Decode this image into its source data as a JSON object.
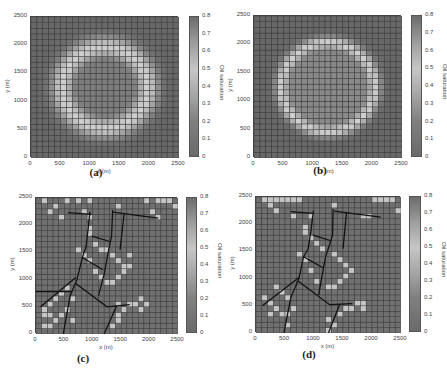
{
  "figure": {
    "colorbar": {
      "label": "Oil saturation",
      "ticks": [
        "0",
        "0.1",
        "0.2",
        "0.3",
        "0.4",
        "0.5",
        "0.6",
        "0.7",
        "0.8"
      ],
      "range": [
        0,
        0.8
      ]
    },
    "axes": {
      "xlabel": "x (m)",
      "ylabel": "y (m)",
      "xticks": [
        "0",
        "500",
        "1000",
        "1500",
        "2000",
        "2500"
      ],
      "yticks": [
        "0",
        "500",
        "1000",
        "1500",
        "2000",
        "2500"
      ],
      "range": [
        0,
        2500
      ],
      "grid_cells": 25
    }
  },
  "chart_data": [
    {
      "type": "heatmap",
      "caption": "(a)",
      "xlabel": "x (m)",
      "ylabel": "y (m)",
      "colorbar_label": "Oil saturation",
      "xlim": [
        0,
        2500
      ],
      "ylim": [
        0,
        2500
      ],
      "clim": [
        0,
        0.8
      ],
      "grid": "25x25 cells of 100 m",
      "pattern": "ring",
      "ring": {
        "cx": 1250,
        "cy": 1250,
        "radius": 720,
        "width": 260,
        "peak": 0.55,
        "background": 0.8,
        "center": 0.75
      },
      "fractures": []
    },
    {
      "type": "heatmap",
      "caption": "(b)",
      "xlabel": "x (m)",
      "ylabel": "y (m)",
      "colorbar_label": "Oil saturation",
      "xlim": [
        0,
        2500
      ],
      "ylim": [
        0,
        2500
      ],
      "clim": [
        0,
        0.8
      ],
      "grid": "25x25 cells of 100 m",
      "pattern": "ring",
      "ring": {
        "cx": 1250,
        "cy": 1250,
        "radius": 780,
        "width": 160,
        "peak": 0.55,
        "background": 0.8,
        "center": 0.72
      },
      "fractures": []
    },
    {
      "type": "heatmap",
      "caption": "(c)",
      "xlabel": "x (m)",
      "ylabel": "y (m)",
      "colorbar_label": "Oil saturation",
      "xlim": [
        0,
        2500
      ],
      "ylim": [
        0,
        2500
      ],
      "clim": [
        0,
        0.8
      ],
      "grid": "25x25 cells of 100 m",
      "pattern": "fractured",
      "bright_cells": [
        [
          1,
          24
        ],
        [
          3,
          23
        ],
        [
          5,
          24
        ],
        [
          7,
          24
        ],
        [
          9,
          24
        ],
        [
          19,
          24
        ],
        [
          21,
          24
        ],
        [
          22,
          24
        ],
        [
          23,
          24
        ],
        [
          24,
          23
        ],
        [
          2,
          22
        ],
        [
          4,
          21
        ],
        [
          8,
          22
        ],
        [
          9,
          21
        ],
        [
          14,
          23
        ],
        [
          20,
          22
        ],
        [
          21,
          21
        ],
        [
          9,
          19
        ],
        [
          9,
          18
        ],
        [
          10,
          16
        ],
        [
          11,
          15
        ],
        [
          12,
          15
        ],
        [
          13,
          14
        ],
        [
          14,
          13
        ],
        [
          15,
          12
        ],
        [
          15,
          11
        ],
        [
          14,
          10
        ],
        [
          13,
          9
        ],
        [
          12,
          9
        ],
        [
          11,
          10
        ],
        [
          10,
          11
        ],
        [
          9,
          13
        ],
        [
          8,
          14
        ],
        [
          7,
          15
        ],
        [
          16,
          14
        ],
        [
          16,
          12
        ],
        [
          5,
          8
        ],
        [
          4,
          7
        ],
        [
          3,
          6
        ],
        [
          2,
          5
        ],
        [
          1,
          4
        ],
        [
          1,
          3
        ],
        [
          2,
          3
        ],
        [
          3,
          2
        ],
        [
          2,
          1
        ],
        [
          1,
          1
        ],
        [
          4,
          3
        ],
        [
          5,
          4
        ],
        [
          6,
          2
        ],
        [
          14,
          5
        ],
        [
          15,
          4
        ],
        [
          16,
          5
        ],
        [
          17,
          5
        ],
        [
          18,
          4
        ],
        [
          19,
          5
        ],
        [
          18,
          6
        ],
        [
          14,
          3
        ],
        [
          14,
          2
        ],
        [
          13,
          1
        ],
        [
          6,
          6
        ]
      ],
      "fractures": [
        [
          [
            560,
            2230
          ],
          [
            980,
            2200
          ]
        ],
        [
          [
            950,
            2250
          ],
          [
            920,
            1950
          ],
          [
            880,
            1600
          ],
          [
            820,
            1420
          ],
          [
            720,
            1000
          ],
          [
            600,
            700
          ],
          [
            480,
            0
          ]
        ],
        [
          [
            1350,
            2280
          ],
          [
            1330,
            1800
          ],
          [
            1280,
            1550
          ],
          [
            1200,
            1100
          ],
          [
            1100,
            700
          ]
        ],
        [
          [
            1350,
            2240
          ],
          [
            2150,
            2130
          ]
        ],
        [
          [
            1550,
            2200
          ],
          [
            1480,
            1550
          ]
        ],
        [
          [
            980,
            1800
          ],
          [
            1300,
            1700
          ]
        ],
        [
          [
            820,
            1400
          ],
          [
            1180,
            1180
          ]
        ],
        [
          [
            80,
            500
          ],
          [
            700,
            1040
          ]
        ],
        [
          [
            0,
            780
          ],
          [
            620,
            780
          ]
        ],
        [
          [
            700,
            930
          ],
          [
            1250,
            500
          ],
          [
            1650,
            540
          ]
        ],
        [
          [
            1420,
            520
          ],
          [
            1200,
            0
          ]
        ]
      ]
    },
    {
      "type": "heatmap",
      "caption": "(d)",
      "xlabel": "x (m)",
      "ylabel": "y (m)",
      "colorbar_label": "Oil saturation",
      "xlim": [
        0,
        2500
      ],
      "ylim": [
        0,
        2500
      ],
      "clim": [
        0,
        0.8
      ],
      "grid": "25x25 cells of 100 m",
      "pattern": "fractured",
      "bright_cells": [
        [
          1,
          24
        ],
        [
          2,
          24
        ],
        [
          3,
          24
        ],
        [
          4,
          24
        ],
        [
          5,
          24
        ],
        [
          6,
          24
        ],
        [
          7,
          24
        ],
        [
          20,
          24
        ],
        [
          21,
          24
        ],
        [
          22,
          24
        ],
        [
          23,
          24
        ],
        [
          24,
          22
        ],
        [
          2,
          23
        ],
        [
          3,
          22
        ],
        [
          6,
          21
        ],
        [
          9,
          21
        ],
        [
          13,
          23
        ],
        [
          18,
          21
        ],
        [
          19,
          21
        ],
        [
          8,
          19
        ],
        [
          8,
          18
        ],
        [
          9,
          17
        ],
        [
          10,
          16
        ],
        [
          11,
          15
        ],
        [
          13,
          14
        ],
        [
          14,
          13
        ],
        [
          15,
          12
        ],
        [
          16,
          11
        ],
        [
          15,
          10
        ],
        [
          14,
          9
        ],
        [
          13,
          8
        ],
        [
          12,
          8
        ],
        [
          10,
          9
        ],
        [
          9,
          11
        ],
        [
          8,
          13
        ],
        [
          7,
          14
        ],
        [
          3,
          8
        ],
        [
          4,
          7
        ],
        [
          5,
          6
        ],
        [
          1,
          6
        ],
        [
          2,
          5
        ],
        [
          3,
          4
        ],
        [
          4,
          3
        ],
        [
          5,
          3
        ],
        [
          6,
          4
        ],
        [
          2,
          3
        ],
        [
          17,
          5
        ],
        [
          18,
          4
        ],
        [
          16,
          4
        ],
        [
          15,
          4
        ],
        [
          14,
          3
        ],
        [
          12,
          2
        ],
        [
          13,
          1
        ],
        [
          18,
          5
        ],
        [
          5,
          1
        ],
        [
          12,
          0
        ]
      ],
      "fractures": [
        [
          [
            600,
            2230
          ],
          [
            980,
            2200
          ]
        ],
        [
          [
            990,
            2250
          ],
          [
            950,
            1900
          ],
          [
            900,
            1550
          ],
          [
            820,
            1400
          ],
          [
            740,
            1000
          ],
          [
            600,
            650
          ],
          [
            480,
            0
          ]
        ],
        [
          [
            1330,
            2280
          ],
          [
            1320,
            1800
          ],
          [
            1200,
            1400
          ],
          [
            1130,
            1000
          ],
          [
            1080,
            700
          ]
        ],
        [
          [
            1350,
            2240
          ],
          [
            2150,
            2130
          ]
        ],
        [
          [
            1560,
            2200
          ],
          [
            1500,
            1550
          ]
        ],
        [
          [
            980,
            1800
          ],
          [
            1280,
            1700
          ]
        ],
        [
          [
            820,
            1400
          ],
          [
            1170,
            1190
          ]
        ],
        [
          [
            110,
            500
          ],
          [
            740,
            1020
          ]
        ],
        [
          [
            730,
            950
          ],
          [
            1270,
            520
          ],
          [
            1660,
            540
          ]
        ],
        [
          [
            1440,
            520
          ],
          [
            1250,
            0
          ]
        ]
      ]
    }
  ],
  "panels": [
    {
      "caption": "(a)"
    },
    {
      "caption": "(b)"
    },
    {
      "caption": "(c)"
    },
    {
      "caption": "(d)"
    }
  ]
}
